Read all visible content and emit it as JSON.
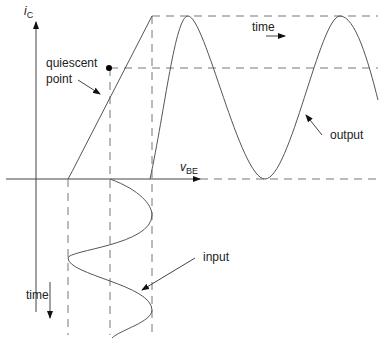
{
  "labels": {
    "y_axis": "i",
    "y_axis_sub": "C",
    "x_axis": "v",
    "x_axis_sub": "BE",
    "quiescent": "quiescent",
    "point": "point",
    "time_top": "time",
    "output": "output",
    "input": "input",
    "time_left": "time"
  },
  "colors": {
    "line": "#555555",
    "dash": "#777777",
    "text": "#222222"
  }
}
